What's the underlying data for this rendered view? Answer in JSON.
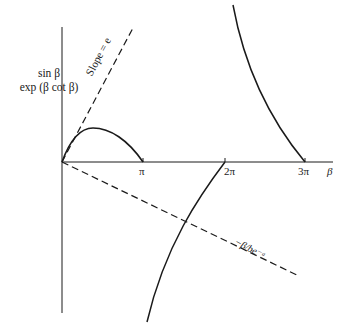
{
  "figure": {
    "y_axis_label_line1": "sin β",
    "y_axis_label_line2": "exp (β cot β)",
    "x_axis_label": "β",
    "ticks": [
      {
        "label": "π"
      },
      {
        "label": "2π"
      },
      {
        "label": "3π"
      }
    ],
    "slope_line_label": "Slope = e",
    "neg_line_label": "−β/be⁻ᵃ"
  },
  "colors": {
    "ink": "#1a1a1a",
    "background": "#ffffff"
  }
}
